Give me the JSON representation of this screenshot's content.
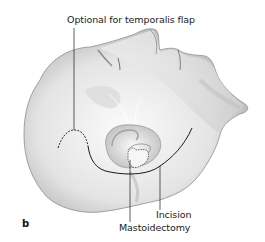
{
  "figure": {
    "panel_label": "b",
    "labels": {
      "temporalis": "Optional for temporalis flap",
      "incision": "Incision",
      "mastoidectomy": "Mastoidectomy"
    },
    "colors": {
      "skin_light": "#f4f4f4",
      "skin_mid": "#d6d6d6",
      "skin_dark": "#9a9a9a",
      "line": "#1a1a1a",
      "text": "#222222"
    }
  }
}
